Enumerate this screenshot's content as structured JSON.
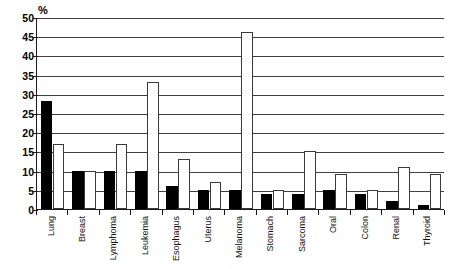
{
  "chart_data": {
    "type": "bar",
    "title": "",
    "subtitle": "",
    "xlabel": "",
    "ylabel": "%",
    "unit_label": "%",
    "ylim": [
      0,
      50
    ],
    "ytick_step": 5,
    "yticks": [
      "0",
      "5",
      "10",
      "15",
      "20",
      "25",
      "30",
      "35",
      "40",
      "45",
      "50"
    ],
    "grid": true,
    "legend": false,
    "legend_position": "none",
    "orientation": "vertical",
    "categories": [
      "Lung",
      "Breast",
      "Lymphoma",
      "Leukemia",
      "Esophagus",
      "Uterus",
      "Melanoma",
      "Stomach",
      "Sarcoma",
      "Oral",
      "Colon",
      "Renal",
      "Thyroid"
    ],
    "series": [
      {
        "name": "black",
        "fill": "#000000",
        "values": [
          28,
          10,
          10,
          10,
          6,
          5,
          5,
          4,
          4,
          5,
          4,
          2,
          1
        ]
      },
      {
        "name": "white",
        "fill": "#ffffff",
        "values": [
          17,
          10,
          17,
          33,
          13,
          7,
          46,
          5,
          15,
          9,
          5,
          11,
          9
        ]
      }
    ]
  },
  "colors": {
    "axis": "#1a1a1a",
    "grid": "#404040",
    "black_bar": "#000000",
    "white_bar": "#ffffff",
    "white_bar_edge": "#3a3a3a",
    "background": "#ffffff",
    "text": "#111111"
  }
}
